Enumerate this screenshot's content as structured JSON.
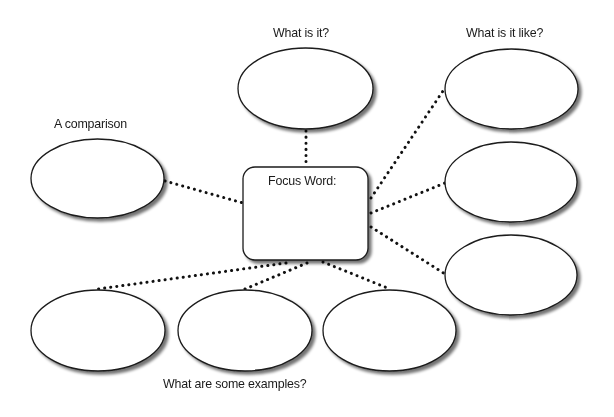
{
  "diagram": {
    "type": "concept-map",
    "colors": {
      "stroke": "#1a1a1a",
      "fill": "#ffffff",
      "dots": "#111111",
      "shadow": "#9a9a9a"
    },
    "center": {
      "label": "Focus Word:"
    },
    "labels": {
      "what_is_it": "What is it?",
      "what_is_it_like": "What is it like?",
      "comparison": "A comparison",
      "examples": "What are some examples?"
    },
    "nodes": [
      {
        "id": "what-is-it",
        "group": "what_is_it",
        "text": ""
      },
      {
        "id": "like-1",
        "group": "what_is_it_like",
        "text": ""
      },
      {
        "id": "like-2",
        "group": "what_is_it_like",
        "text": ""
      },
      {
        "id": "like-3",
        "group": "what_is_it_like",
        "text": ""
      },
      {
        "id": "comparison",
        "group": "comparison",
        "text": ""
      },
      {
        "id": "example-1",
        "group": "examples",
        "text": ""
      },
      {
        "id": "example-2",
        "group": "examples",
        "text": ""
      },
      {
        "id": "example-3",
        "group": "examples",
        "text": ""
      }
    ]
  }
}
